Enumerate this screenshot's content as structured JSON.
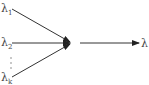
{
  "diagram": {
    "inputs": [
      {
        "symbol": "λ",
        "subscript": "1"
      },
      {
        "symbol": "λ",
        "subscript": "2"
      },
      {
        "symbol": "λ",
        "subscript": "k"
      }
    ],
    "ellipsis": "⋮",
    "output": {
      "symbol": "λ"
    },
    "stroke_color": "#222222"
  }
}
